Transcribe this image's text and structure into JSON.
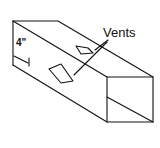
{
  "diagram": {
    "labels": {
      "vents": "Vents",
      "dimension": "4\""
    },
    "colors": {
      "line": "#111111",
      "background": "#ffffff"
    }
  }
}
